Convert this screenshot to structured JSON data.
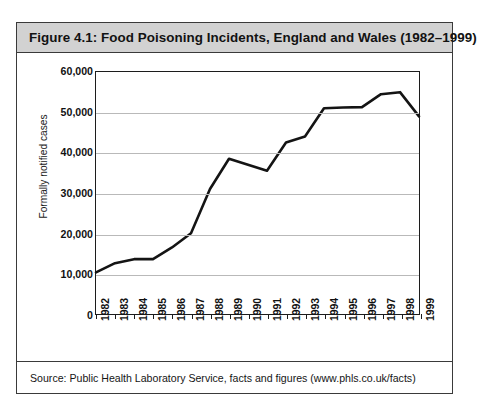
{
  "ghost_header": "",
  "figure": {
    "title": "Figure 4.1: Food Poisoning Incidents, England and Wales (1982–1999)",
    "source": "Source: Public Health Laboratory Service, facts and figures (www.phls.co.uk/facts)"
  },
  "colors": {
    "title_band_background": "#d2d2d2",
    "border": "#3a3a3a",
    "gridline": "#b9b9b9",
    "series_line": "#141414",
    "plot_background": "#ffffff"
  },
  "chart_data": {
    "type": "line",
    "title": "Figure 4.1: Food Poisoning Incidents, England and Wales (1982–1999)",
    "xlabel": "",
    "ylabel": "Formally notified cases",
    "ylim": [
      0,
      60000
    ],
    "ytick_labels": [
      "0",
      "10,000",
      "20,000",
      "30,000",
      "40,000",
      "50,000",
      "60,000"
    ],
    "ytick_values": [
      0,
      10000,
      20000,
      30000,
      40000,
      50000,
      60000
    ],
    "grid": true,
    "legend": null,
    "categories": [
      "1982",
      "1983",
      "1984",
      "1985",
      "1986",
      "1987",
      "1988",
      "1989",
      "1990",
      "1991",
      "1992",
      "1993",
      "1994",
      "1995",
      "1996",
      "1997",
      "1998",
      "1999"
    ],
    "series": [
      {
        "name": "Formally notified cases",
        "values": [
          10300,
          12600,
          13600,
          13600,
          16500,
          20000,
          31000,
          38500,
          37000,
          35500,
          42500,
          44000,
          51000,
          51200,
          51300,
          54500,
          55000,
          49000
        ]
      }
    ]
  }
}
